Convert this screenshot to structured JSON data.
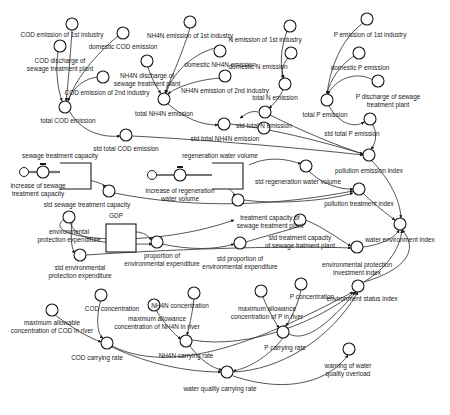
{
  "diagram": {
    "type": "system-dynamics stock-flow diagram",
    "colors": {
      "ink": "#1a1a1a",
      "background": "#ffffff"
    },
    "variables": [
      {
        "id": "cod1",
        "label": "COD emission of 1st industry",
        "x": 72,
        "y": 24,
        "lx": 62,
        "ly": 37
      },
      {
        "id": "codDom",
        "label": "domestic COD emission",
        "x": 123,
        "y": 33,
        "lx": 123,
        "ly": 49
      },
      {
        "id": "codSew",
        "label": "COD discharge of sewage treatment plant",
        "lines": [
          "COD discharge of",
          "sewage treatment plant"
        ],
        "x": 60,
        "y": 46,
        "lx": 60,
        "ly": 63
      },
      {
        "id": "cod2",
        "label": "COD emission of 2nd industry",
        "x": 103,
        "y": 77,
        "lx": 107,
        "ly": 95
      },
      {
        "id": "codTot",
        "label": "total COD emission",
        "x": 65,
        "y": 107,
        "lx": 68,
        "ly": 123
      },
      {
        "id": "codStd",
        "label": "std total COD emission",
        "x": 126,
        "y": 135,
        "lx": 126,
        "ly": 151
      },
      {
        "id": "nh1",
        "label": "NH4N emission of 1st industry",
        "x": 190,
        "y": 22,
        "lx": 190,
        "ly": 38
      },
      {
        "id": "nhDom",
        "label": "domestic NH4N emission",
        "x": 220,
        "y": 51,
        "lx": 220,
        "ly": 67
      },
      {
        "id": "nhSew",
        "label": "NH4N discharge of sewage treatment plant",
        "lines": [
          "NH4N discharge of",
          "sewage treatment plant"
        ],
        "x": 147,
        "y": 61,
        "lx": 147,
        "ly": 78
      },
      {
        "id": "nh2",
        "label": "NH4N emission of 2nd industry",
        "x": 225,
        "y": 76,
        "lx": 225,
        "ly": 93
      },
      {
        "id": "nhTot",
        "label": "total NH4N emission",
        "x": 164,
        "y": 99,
        "lx": 164,
        "ly": 116
      },
      {
        "id": "nhStd",
        "label": "std total NH4N emission",
        "x": 224,
        "y": 124,
        "lx": 225,
        "ly": 141
      },
      {
        "id": "n1",
        "label": "N emission of 1st industry",
        "x": 290,
        "y": 26,
        "lx": 265,
        "ly": 42
      },
      {
        "id": "nDom",
        "label": "domestic N emission",
        "x": 291,
        "y": 53,
        "lx": 258,
        "ly": 69
      },
      {
        "id": "nTot",
        "label": "total N emission",
        "x": 285,
        "y": 84,
        "lx": 275,
        "ly": 100
      },
      {
        "id": "nTotB",
        "label": "",
        "x": 265,
        "y": 112,
        "lx": 0,
        "ly": 0
      },
      {
        "id": "nStd",
        "label": "std total N emission",
        "x": 264,
        "y": 128,
        "lx": 264,
        "ly": 128
      },
      {
        "id": "p1",
        "label": "P emission of 1st industry",
        "x": 367,
        "y": 19,
        "lx": 370,
        "ly": 37
      },
      {
        "id": "pDom",
        "label": "domestic P emission",
        "x": 359,
        "y": 53,
        "lx": 360,
        "ly": 70
      },
      {
        "id": "pSew",
        "label": "P discharge of sewage treatment plant",
        "lines": [
          "P discharge of sewage",
          "treatment plant"
        ],
        "x": 378,
        "y": 81,
        "lx": 388,
        "ly": 99
      },
      {
        "id": "pTot",
        "label": "total P emission",
        "x": 327,
        "y": 100,
        "lx": 325,
        "ly": 117
      },
      {
        "id": "pStd",
        "label": "std total P emission",
        "x": 370,
        "y": 119,
        "lx": 352,
        "ly": 136
      },
      {
        "id": "polEm",
        "label": "pollution emission index",
        "x": 369,
        "y": 155,
        "lx": 369,
        "ly": 173
      },
      {
        "id": "regStd",
        "label": "std regeneration water volume",
        "x": 306,
        "y": 166,
        "lx": 298,
        "ly": 184
      },
      {
        "id": "polTr",
        "label": "pollution treatment index",
        "x": 359,
        "y": 189,
        "lx": 359,
        "ly": 206
      },
      {
        "id": "sewStd",
        "label": "std sewage treatment capacity",
        "x": 109,
        "y": 191,
        "lx": 87,
        "ly": 207
      },
      {
        "id": "tcap",
        "label": "treatment capacity of sewage treatment plant",
        "lines": [
          "treatment capacity of",
          "sewage treatment plant"
        ],
        "x": 238,
        "y": 200,
        "lx": 270,
        "ly": 220
      },
      {
        "id": "tcapStd",
        "label": "std treatment capacity of sewage tratment plant",
        "lines": [
          "std treatment capacity",
          "of sewage tratment plant"
        ],
        "x": 300,
        "y": 220,
        "lx": 300,
        "ly": 240
      },
      {
        "id": "gdp",
        "label": "GDP",
        "x": 0,
        "y": 0,
        "lx": 116,
        "ly": 218
      },
      {
        "id": "envExp",
        "label": "environmental protection expenditure",
        "lines": [
          "environmental",
          "protection expenditure"
        ],
        "x": 69,
        "y": 217,
        "lx": 69,
        "ly": 234
      },
      {
        "id": "propExp",
        "label": "proportion of environmental expenditure",
        "lines": [
          "proportion of",
          "environmental expenditure"
        ],
        "x": 157,
        "y": 242,
        "lx": 162,
        "ly": 258
      },
      {
        "id": "propStd",
        "label": "std proportion of environmental expenditure",
        "lines": [
          "std proportion of",
          "environmental expenditure"
        ],
        "x": 240,
        "y": 243,
        "lx": 240,
        "ly": 261
      },
      {
        "id": "envExpStd",
        "label": "std environmental protection expenditure",
        "lines": [
          "std environmental",
          "protection expenditure"
        ],
        "x": 80,
        "y": 255,
        "lx": 80,
        "ly": 270
      },
      {
        "id": "waterEnv",
        "label": "water environment index",
        "x": 400,
        "y": 224,
        "lx": 400,
        "ly": 242
      },
      {
        "id": "envInv",
        "label": "environmental protection investment index",
        "lines": [
          "environmental protection",
          "investment index"
        ],
        "x": 357,
        "y": 247,
        "lx": 357,
        "ly": 267
      },
      {
        "id": "envStat",
        "label": "environment status index",
        "x": 358,
        "y": 286,
        "lx": 362,
        "ly": 301
      },
      {
        "id": "codConcS",
        "label": "",
        "x": 101,
        "y": 295,
        "lx": 0,
        "ly": 0
      },
      {
        "id": "codConc",
        "label": "COD concentration",
        "x": 0,
        "y": 0,
        "lx": 112,
        "ly": 311
      },
      {
        "id": "codMax",
        "label": "maximum allowable concentration of COD in river",
        "lines": [
          "maximum allowable",
          "concentration of COD in river"
        ],
        "x": 52,
        "y": 310,
        "lx": 52,
        "ly": 325
      },
      {
        "id": "nhConcS",
        "label": "",
        "x": 194,
        "y": 293,
        "lx": 0,
        "ly": 0
      },
      {
        "id": "nhConc",
        "label": "NH4N concentration",
        "x": 0,
        "y": 0,
        "lx": 180,
        "ly": 308
      },
      {
        "id": "nhMaxS",
        "label": "",
        "x": 154,
        "y": 305,
        "lx": 0,
        "ly": 0
      },
      {
        "id": "nhMax",
        "label": "maximum allowance concentration of NH4N in river",
        "lines": [
          "maximum allowance",
          "concentration of NH4N in river"
        ],
        "x": 0,
        "y": 0,
        "lx": 157,
        "ly": 321
      },
      {
        "id": "pConcS",
        "label": "",
        "x": 301,
        "y": 284,
        "lx": 0,
        "ly": 0
      },
      {
        "id": "pConc",
        "label": "P concentration",
        "x": 0,
        "y": 0,
        "lx": 312,
        "ly": 299
      },
      {
        "id": "pMaxS",
        "label": "",
        "x": 261,
        "y": 291,
        "lx": 0,
        "ly": 0
      },
      {
        "id": "pMax",
        "label": "maximum allowance concentration of P in river",
        "lines": [
          "maximum allowance",
          "concentration of P in river"
        ],
        "x": 0,
        "y": 0,
        "lx": 267,
        "ly": 311
      },
      {
        "id": "codCarry",
        "label": "COD carrying rate",
        "x": 107,
        "y": 343,
        "lx": 97,
        "ly": 360
      },
      {
        "id": "nhCarry",
        "label": "NH4N carrying rate",
        "x": 186,
        "y": 341,
        "lx": 186,
        "ly": 358
      },
      {
        "id": "pCarry",
        "label": "P carrying rate",
        "x": 283,
        "y": 332,
        "lx": 285,
        "ly": 350
      },
      {
        "id": "wqCarry",
        "label": "water quality carrying rate",
        "x": 227,
        "y": 372,
        "lx": 220,
        "ly": 391
      },
      {
        "id": "warn",
        "label": "warning of water quality overload",
        "lines": [
          "warning of water",
          "quality overload"
        ],
        "x": 349,
        "y": 349,
        "lx": 348,
        "ly": 368
      }
    ],
    "stocks": [
      {
        "id": "sewCap",
        "label": "sewage treatment capacity",
        "x": 60,
        "y": 163,
        "w": 31,
        "h": 26,
        "lx": 60,
        "ly": 158
      },
      {
        "id": "regVol",
        "label": "regeneration water volume",
        "x": 212,
        "y": 163,
        "w": 31,
        "h": 26,
        "lx": 220,
        "ly": 158
      },
      {
        "id": "gdpStock",
        "label": "GDP",
        "x": 106,
        "y": 224,
        "w": 30,
        "h": 28,
        "lx": 116,
        "ly": 218
      }
    ],
    "flows": [
      {
        "id": "incSew",
        "label": "increase of sewage treatment capacity",
        "lines": [
          "increase of sewage",
          "treatment capacity"
        ],
        "x": 43,
        "y": 172,
        "cloudX": 24,
        "lx": 38,
        "ly": 188
      },
      {
        "id": "incReg",
        "label": "increase of regeneration water volume",
        "lines": [
          "increase of regeneration",
          "water volume"
        ],
        "x": 180,
        "y": 175,
        "cloudX": 152,
        "lx": 180,
        "ly": 193
      }
    ]
  }
}
